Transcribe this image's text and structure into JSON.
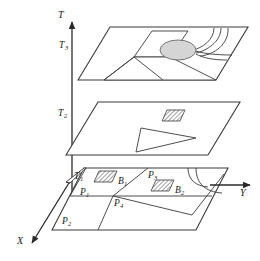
{
  "figure": {
    "kind": "3d-layered-plane-schematic",
    "background_color": "#ffffff",
    "line_color": "#3a3a3a",
    "fill_color": "#ffffff",
    "shade_color": "#d5d5d5",
    "hatch_color": "#555555"
  },
  "axes": {
    "vertical": {
      "label": "T",
      "sub": ""
    },
    "depth": {
      "label": "X",
      "sub": ""
    },
    "horizontal": {
      "label": "Y",
      "sub": ""
    }
  },
  "levels": [
    {
      "label": "T",
      "sub": "3",
      "name": "level-t3"
    },
    {
      "label": "T",
      "sub": "2",
      "name": "level-t2"
    },
    {
      "label": "T",
      "sub": "1",
      "name": "level-t1"
    }
  ],
  "regions": [
    {
      "label": "P",
      "sub": "1",
      "name": "region-p1"
    },
    {
      "label": "P",
      "sub": "2",
      "name": "region-p2"
    },
    {
      "label": "P",
      "sub": "3",
      "name": "region-p3"
    },
    {
      "label": "P",
      "sub": "4",
      "name": "region-p4"
    }
  ],
  "blocks": [
    {
      "label": "B",
      "sub": "1",
      "name": "block-b1"
    },
    {
      "label": "B",
      "sub": "2",
      "name": "block-b2"
    }
  ]
}
